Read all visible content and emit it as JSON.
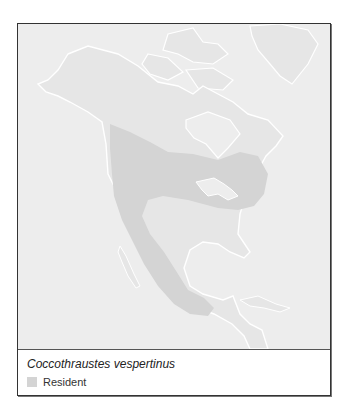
{
  "map": {
    "region": "North America",
    "colors": {
      "ocean": "#ededed",
      "land": "#e6e6e6",
      "coast": "#ffffff",
      "range": "#d4d4d4"
    }
  },
  "caption": {
    "species": "Coccothraustes vespertinus"
  },
  "legend": {
    "items": [
      {
        "label": "Resident",
        "color": "#d4d4d4"
      }
    ]
  }
}
